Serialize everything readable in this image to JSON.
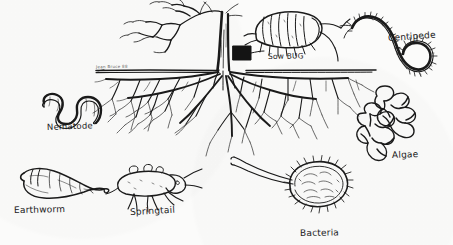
{
  "figure": {
    "background_color": "#fbfbfa",
    "ink_color": "#1a1a1a",
    "medium": "pen-and-ink line drawing",
    "signature": "Jean Bruce 88"
  },
  "labels": {
    "nematode": "Nematode",
    "earthworm": "Earthworm",
    "springtail": "Springtail",
    "bacteria": "Bacteria",
    "sow_bug": "Sow BUG",
    "centipede": "Centipede",
    "algae": "Algae"
  },
  "organisms": [
    {
      "name": "Nematode",
      "label": "Nematode",
      "position": "left-upper",
      "zone": "below-ground",
      "form": "wavy serpentine worm"
    },
    {
      "name": "Earthworm",
      "label": "Earthworm",
      "position": "bottom-left",
      "zone": "below-ground",
      "form": "thick curved segmented worm"
    },
    {
      "name": "Springtail",
      "label": "Springtail",
      "position": "bottom-center-left",
      "zone": "below-ground",
      "form": "oval-bodied insect with legs and antennae"
    },
    {
      "name": "Bacteria",
      "label": "Bacteria",
      "position": "bottom-center-right",
      "zone": "below-ground",
      "form": "rod cell with pili and two flagella"
    },
    {
      "name": "Sow Bug",
      "label": "Sow BUG",
      "position": "top-center-right",
      "zone": "above-ground",
      "form": "segmented isopod with legs and antennae"
    },
    {
      "name": "Centipede",
      "label": "Centipede",
      "position": "top-right",
      "zone": "above-ground",
      "form": "long S-curved many-legged body"
    },
    {
      "name": "Algae",
      "label": "Algae",
      "position": "right-middle",
      "zone": "below-ground",
      "form": "two chains of polygonal cells"
    }
  ],
  "scene": {
    "tree": {
      "name": "tree",
      "trunk": "central trunk with bare branching canopy to the left",
      "roots": "dense fibrous root system spreading below the soil line"
    },
    "soil_line": {
      "name": "soil line",
      "description": "horizontal ground surface line"
    },
    "trunk_marker": {
      "name": "trunk marker",
      "description": "solid dark rectangle at base of trunk"
    }
  }
}
